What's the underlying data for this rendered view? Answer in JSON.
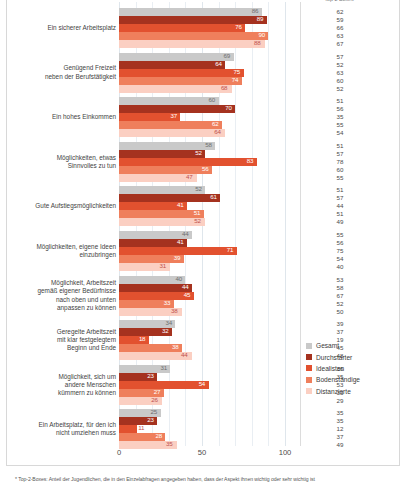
{
  "chart_data": {
    "type": "bar",
    "orientation": "horizontal",
    "title": "",
    "xlabel": "",
    "ylabel": "",
    "xlim": [
      0,
      100
    ],
    "xticks": [
      "0",
      "50",
      "100"
    ],
    "grid": true,
    "legend_position": "right",
    "right_column_header": "Top-2-Boxes*",
    "categories": [
      "Ein sicherer Arbeitsplatz",
      "Genügend Freizeit\nneben der Berufstätigkeit",
      "Ein hohes Einkommen",
      "Möglichkeiten, etwas\nSinnvolles zu tun",
      "Gute Aufstiegsmöglichkeiten",
      "Möglichkeiten, eigene Ideen\neinzubringen",
      "Möglichkeit, Arbeitszeit\ngemäß eigener Bedürfnisse\nnach oben und unten\nanpassen zu können",
      "Geregelte Arbeitszeit\nmit klar festgelegtem\nBeginn und Ende",
      "Möglichkeit, sich um\nandere Menschen\nkümmern zu können",
      "Ein Arbeitsplatz, für den ich\nnicht umziehen muss"
    ],
    "series": [
      {
        "name": "Gesamt",
        "color": "#c9c9c9",
        "values": [
          86,
          69,
          60,
          58,
          52,
          44,
          40,
          34,
          31,
          25
        ]
      },
      {
        "name": "Durchstarter",
        "color": "#a5321f",
        "values": [
          89,
          64,
          70,
          52,
          61,
          41,
          44,
          32,
          23,
          23
        ]
      },
      {
        "name": "Idealisten",
        "color": "#e2512f",
        "values": [
          76,
          75,
          37,
          83,
          41,
          71,
          45,
          18,
          54,
          11
        ]
      },
      {
        "name": "Bodenständige",
        "color": "#ef7f5c",
        "values": [
          90,
          74,
          62,
          56,
          51,
          39,
          33,
          38,
          27,
          28
        ]
      },
      {
        "name": "Distanzierte",
        "color": "#fbcfc2",
        "values": [
          88,
          68,
          64,
          47,
          52,
          31,
          38,
          44,
          26,
          35
        ]
      }
    ],
    "right_column_values": [
      [
        62,
        59,
        66,
        63,
        67
      ],
      [
        57,
        52,
        63,
        60,
        52
      ],
      [
        51,
        56,
        35,
        55,
        54
      ],
      [
        51,
        57,
        78,
        60,
        55
      ],
      [
        51,
        57,
        44,
        51,
        49
      ],
      [
        55,
        56,
        75,
        54,
        40
      ],
      [
        53,
        58,
        67,
        52,
        50
      ],
      [
        39,
        37,
        19,
        45,
        48
      ],
      [
        36,
        35,
        53,
        33,
        29
      ],
      [
        35,
        35,
        12,
        37,
        49
      ]
    ],
    "footnote": "* Top-2-Boxes: Anteil der Jugendlichen, die in den Einzelabfragen angegeben haben, dass der Aspekt ihnen wichtig oder sehr wichtig ist"
  }
}
